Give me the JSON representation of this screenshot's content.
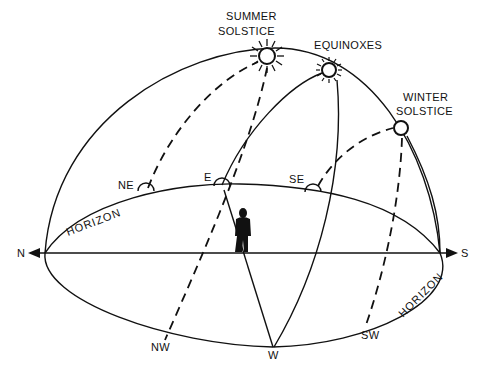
{
  "diagram": {
    "labels": {
      "summer_solstice_line1": "SUMMER",
      "summer_solstice_line2": "SOLSTICE",
      "equinoxes": "EQUINOXES",
      "winter_solstice_line1": "WINTER",
      "winter_solstice_line2": "SOLSTICE",
      "horizon_left": "HORIZON",
      "horizon_right": "HORIZON"
    },
    "directions": {
      "north": "N",
      "south": "S",
      "east": "E",
      "west": "W",
      "northeast": "NE",
      "northwest": "NW",
      "southeast": "SE",
      "southwest": "SW"
    },
    "sun_paths": [
      {
        "season": "Summer Solstice",
        "rise": "NE",
        "set": "NW",
        "style": "dashed"
      },
      {
        "season": "Equinoxes",
        "rise": "E",
        "set": "W",
        "style": "solid"
      },
      {
        "season": "Winter Solstice",
        "rise": "SE",
        "set": "SW",
        "style": "dashed"
      }
    ],
    "colors": {
      "ink": "#111111",
      "background": "#ffffff"
    }
  }
}
